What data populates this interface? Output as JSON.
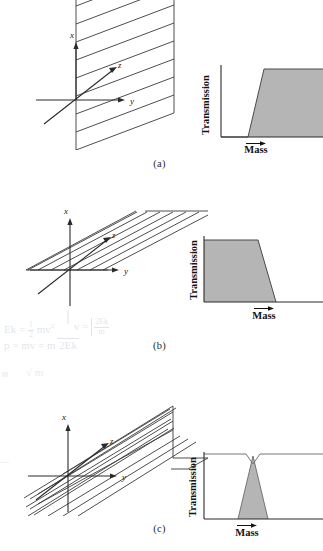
{
  "figure": {
    "background_color": "#ffffff",
    "line_color": "#3a3a3a",
    "fill_color": "#b5b5b5",
    "panels": [
      {
        "id": "a",
        "label": "(a)",
        "diagram": {
          "axes": {
            "x_label": "x",
            "y_label": "y",
            "z_label": "z"
          },
          "surface": "single slanted plane rising from the y-axis toward +z, hatched with 8 parallel lines",
          "hatch_count": 8
        },
        "chart": {
          "type": "area",
          "title": "",
          "ylabel": "Transmission",
          "xlabel": "Mass",
          "xlabel_arrow": true,
          "shape": "high-pass: rises steeply from zero then stays at maximum",
          "x": [
            0,
            0.42,
            0.56,
            1.0
          ],
          "y": [
            0,
            0,
            1.0,
            1.0
          ],
          "ylim": [
            0,
            1.15
          ],
          "xlim": [
            0,
            1
          ],
          "grid": false,
          "axis_ticks": false
        }
      },
      {
        "id": "b",
        "label": "(b)",
        "diagram": {
          "axes": {
            "x_label": "x",
            "y_label": "y",
            "z_label": "z"
          },
          "surface": "single slanted plane inclined upward to the right, hatched with 7 parallel lines",
          "hatch_count": 7
        },
        "chart": {
          "type": "area",
          "title": "",
          "ylabel": "Transmission",
          "xlabel": "Mass",
          "xlabel_arrow": true,
          "shape": "low-pass: stays at maximum then falls steeply to zero",
          "x": [
            0,
            0.62,
            0.78,
            1.0
          ],
          "y": [
            1.0,
            1.0,
            0,
            0
          ],
          "ylim": [
            0,
            1.15
          ],
          "xlim": [
            0,
            1
          ],
          "grid": false,
          "axis_ticks": false
        }
      },
      {
        "id": "c",
        "label": "(c)",
        "diagram": {
          "axes": {
            "x_label": "x",
            "y_label": "y",
            "z_label": "z"
          },
          "surface": "two intersecting planes: a slanted hatched plane meeting a second plane folding to the right",
          "hatch_count": 8
        },
        "chart": {
          "type": "line",
          "title": "",
          "ylabel": "Transmission",
          "xlabel": "Mass",
          "xlabel_arrow": true,
          "shape": "band-pass notch: flat high line dips sharply to zero and returns; shaded triangle peak under the dip",
          "line_x": [
            0,
            0.46,
            0.54,
            1.0
          ],
          "line_y": [
            1.0,
            1.0,
            0.0,
            1.0
          ],
          "fill_x": [
            0.4,
            0.5,
            0.6
          ],
          "fill_y": [
            0.0,
            1.0,
            0.0
          ],
          "ylim": [
            0,
            1.1
          ],
          "xlim": [
            0,
            1
          ],
          "grid": false,
          "axis_ticks": false
        }
      }
    ]
  },
  "annotations": {
    "handwriting_visible": true,
    "notes": [
      "Ek = 1/2 mv²",
      "v = √(2Ek/m)",
      "p = mv = m √(2Ek/m)"
    ],
    "note_line1_lhs": "Ek =",
    "note_line1_frac_num": "1",
    "note_line1_frac_den": "2",
    "note_line1_rhs": "mv",
    "note_line1_exp": "2",
    "note_line2_lhs": "p = mv =",
    "note_line2_rhs": "m",
    "note_line2_radicand": "2Ek",
    "note_line3_lhs": "v =",
    "note_line3_num": "2Ek",
    "note_line3_den": "m"
  }
}
